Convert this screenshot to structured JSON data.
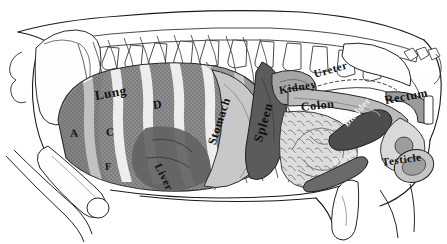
{
  "figure": {
    "style": "grayscale pen-and-ink anatomical engraving",
    "view": "left lateral (side) view, head to the left, tail to the right",
    "background_color": "#ffffff",
    "ink_color": "#1a1a1a"
  },
  "labels": [
    {
      "id": "lung",
      "text": "Lung",
      "x": 95,
      "y": 88,
      "size": 13,
      "rotate": -10,
      "style": "script"
    },
    {
      "id": "lung-a",
      "text": "A",
      "x": 70,
      "y": 127,
      "size": 11,
      "rotate": -4,
      "style": "letter"
    },
    {
      "id": "lung-c",
      "text": "C",
      "x": 106,
      "y": 126,
      "size": 11,
      "rotate": -4,
      "style": "letter"
    },
    {
      "id": "lung-f",
      "text": "F",
      "x": 105,
      "y": 161,
      "size": 10,
      "rotate": -4,
      "style": "letter"
    },
    {
      "id": "lung-d",
      "text": "D",
      "x": 153,
      "y": 98,
      "size": 12,
      "rotate": -8,
      "style": "letter"
    },
    {
      "id": "liver",
      "text": "Liver",
      "x": 158,
      "y": 158,
      "size": 11,
      "rotate": 64,
      "style": "script"
    },
    {
      "id": "stomach",
      "text": "Stomach",
      "x": 212,
      "y": 137,
      "size": 12,
      "rotate": -72,
      "style": "script"
    },
    {
      "id": "spleen",
      "text": "Spleen",
      "x": 258,
      "y": 134,
      "size": 13,
      "rotate": -74,
      "style": "script"
    },
    {
      "id": "kidney",
      "text": "Kidney",
      "x": 279,
      "y": 84,
      "size": 11,
      "rotate": -10,
      "style": "script"
    },
    {
      "id": "colon",
      "text": "Colon",
      "x": 301,
      "y": 100,
      "size": 12,
      "rotate": -6,
      "style": "script"
    },
    {
      "id": "ureter",
      "text": "Ureter",
      "x": 314,
      "y": 68,
      "size": 11,
      "rotate": -16,
      "style": "script"
    },
    {
      "id": "rectum",
      "text": "Rectum",
      "x": 385,
      "y": 93,
      "size": 12,
      "rotate": -10,
      "style": "script"
    },
    {
      "id": "bladder",
      "text": "Bladder",
      "x": 345,
      "y": 120,
      "size": 9,
      "rotate": -48,
      "style": "script"
    },
    {
      "id": "penis",
      "text": "Penis",
      "x": 333,
      "y": 157,
      "size": 10,
      "rotate": -26,
      "style": "script"
    },
    {
      "id": "testicle",
      "text": "Testicle",
      "x": 382,
      "y": 156,
      "size": 11,
      "rotate": -8,
      "style": "script"
    }
  ],
  "organs": [
    {
      "id": "lung",
      "name": "Lung",
      "fill": "#8e8e8e",
      "texture": "stippled",
      "note": "large striped mass filling the rib cage, crossed by pale rib bands"
    },
    {
      "id": "liver",
      "name": "Liver",
      "fill": "#6f6f6f",
      "texture": "solid",
      "note": "dark lobes behind the caudal ribs"
    },
    {
      "id": "stomach",
      "name": "Stomach",
      "fill": "#c9c9c9",
      "texture": "light",
      "note": "pale rounded sac behind the diaphragm"
    },
    {
      "id": "spleen",
      "name": "Spleen",
      "fill": "#5a5a5a",
      "texture": "solid",
      "note": "dark elongated tongue-shaped organ"
    },
    {
      "id": "kidney",
      "name": "Kidney",
      "fill": "#a8a8a8",
      "texture": "solid",
      "note": "bean-shaped, dorsal, below the lumbar spine"
    },
    {
      "id": "colon",
      "name": "Colon",
      "fill": "#bdbdbd",
      "texture": "light",
      "note": "broad pale tube running caudally"
    },
    {
      "id": "ureter",
      "name": "Ureter",
      "fill": "#d0d0d0",
      "texture": "line",
      "note": "thin duct from kidney to bladder"
    },
    {
      "id": "intestine",
      "name": "Intestines",
      "fill": "#d8d8d8",
      "texture": "coiled",
      "note": "coiled small intestine filling the ventral abdomen"
    },
    {
      "id": "bladder",
      "name": "Bladder",
      "fill": "#4f4f4f",
      "texture": "solid",
      "note": "dark pear-shaped sac in the pelvis"
    },
    {
      "id": "rectum",
      "name": "Rectum",
      "fill": "#9a9a9a",
      "texture": "solid",
      "note": "terminal bowel at the tail base"
    },
    {
      "id": "penis",
      "name": "Penis",
      "fill": "#6a6a6a",
      "texture": "solid",
      "note": "ventral cord running forward under the abdomen"
    },
    {
      "id": "testicle",
      "name": "Testicle",
      "fill": "#c4c4c4",
      "texture": "solid",
      "note": "oval body at the rear between the hind limbs"
    }
  ],
  "skeleton": [
    {
      "id": "spine",
      "name": "Vertebral column",
      "note": "row of dorsal vertebrae with spinous processes along the back"
    },
    {
      "id": "ribs",
      "name": "Rib cage",
      "count": 14,
      "note": "pale curved ribs over the lung"
    },
    {
      "id": "scapula",
      "name": "Scapula",
      "note": "large pale shoulder blade at the front"
    },
    {
      "id": "humerus",
      "name": "Foreleg bone",
      "note": "long bone angling down and forward"
    },
    {
      "id": "pelvis",
      "name": "Pelvis",
      "note": "hip bone at the rear"
    },
    {
      "id": "femur",
      "name": "Hind-leg bone",
      "note": "long bone angling down and back"
    },
    {
      "id": "tail",
      "name": "Caudal vertebrae",
      "note": "small bones at the tail"
    },
    {
      "id": "body-outline",
      "name": "Body outline",
      "note": "continuous contour of the hog's back, belly and legs"
    }
  ]
}
